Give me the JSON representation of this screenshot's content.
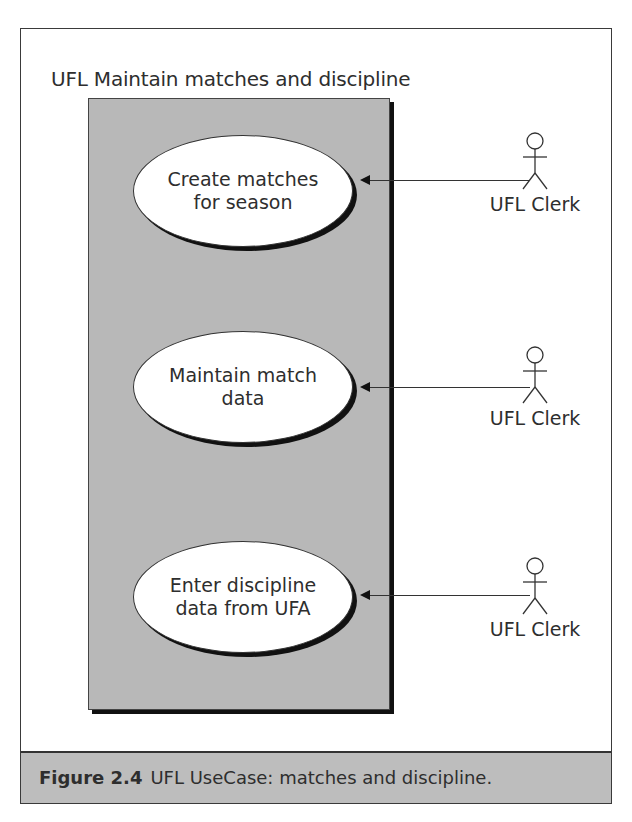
{
  "diagram": {
    "title": "UFL Maintain matches and discipline",
    "use_cases": [
      {
        "line1": "Create matches",
        "line2": "for season"
      },
      {
        "line1": "Maintain match",
        "line2": "data"
      },
      {
        "line1": "Enter discipline",
        "line2": "data from UFA"
      }
    ],
    "actors": [
      {
        "label": "UFL Clerk"
      },
      {
        "label": "UFL Clerk"
      },
      {
        "label": "UFL Clerk"
      }
    ],
    "colors": {
      "system_box": "#b8b8b8",
      "caption_band": "#bdbdbd",
      "line": "#333333"
    }
  },
  "caption": {
    "number": "Figure 2.4",
    "text": "UFL UseCase: matches and discipline."
  }
}
